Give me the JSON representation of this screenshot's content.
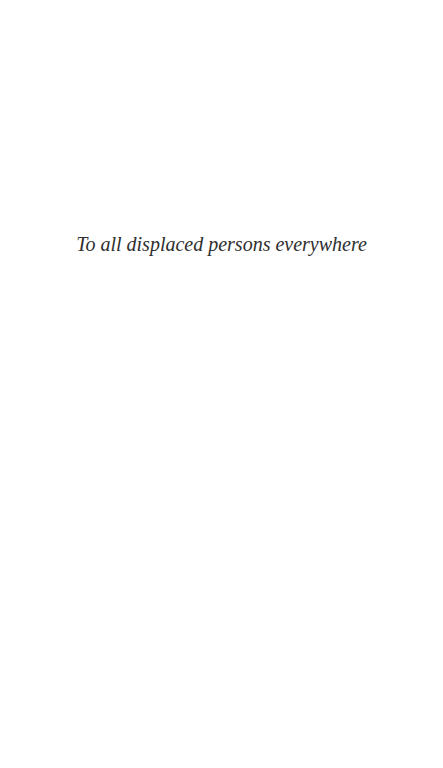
{
  "page": {
    "background": "#ffffff",
    "text_color": "#2e2e2e"
  },
  "dedication": {
    "text": "To all displaced persons everywhere"
  }
}
